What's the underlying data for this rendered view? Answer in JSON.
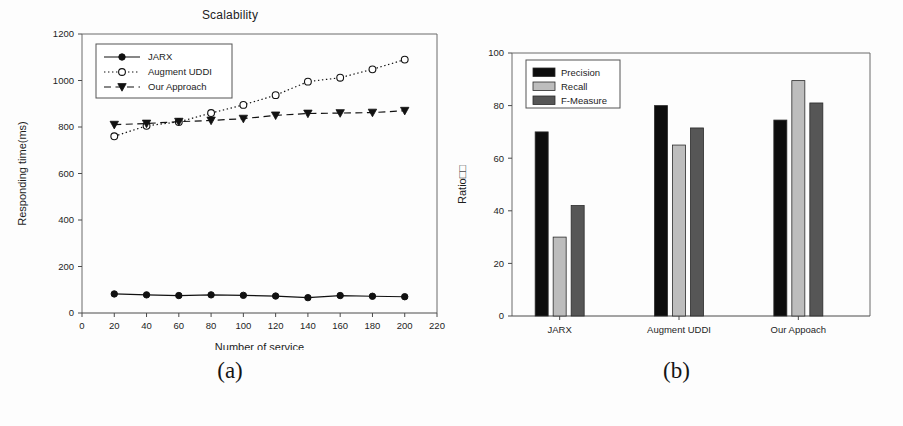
{
  "figure": {
    "panel_a_caption": "(a)",
    "panel_b_caption": "(b)"
  },
  "chart_data": [
    {
      "id": "scalability",
      "type": "line",
      "title": "Scalability",
      "xlabel": "Number of service",
      "ylabel": "Responding time(ms)",
      "xlim": [
        0,
        220
      ],
      "ylim": [
        0,
        1200
      ],
      "xticks": [
        0,
        20,
        40,
        60,
        80,
        100,
        120,
        140,
        160,
        180,
        200,
        220
      ],
      "yticks": [
        0,
        200,
        400,
        600,
        800,
        1000,
        1200
      ],
      "grid": false,
      "legend_position": "upper-left-inside",
      "x": [
        20,
        40,
        60,
        80,
        100,
        120,
        140,
        160,
        180,
        200
      ],
      "series": [
        {
          "name": "JARX",
          "marker": "filled-circle",
          "line_style": "solid",
          "color": "#111111",
          "values": [
            82,
            78,
            75,
            78,
            76,
            73,
            66,
            75,
            72,
            70
          ]
        },
        {
          "name": "Augment UDDI",
          "marker": "open-circle",
          "line_style": "dotted",
          "color": "#111111",
          "values": [
            760,
            805,
            822,
            860,
            895,
            937,
            995,
            1012,
            1048,
            1090
          ]
        },
        {
          "name": "Our Approach",
          "marker": "filled-triangle-down",
          "line_style": "dashed",
          "color": "#111111",
          "values": [
            810,
            815,
            823,
            828,
            836,
            850,
            858,
            860,
            862,
            870
          ]
        }
      ]
    },
    {
      "id": "ratio",
      "type": "bar",
      "title": "",
      "xlabel": "",
      "ylabel": "Ratio□□",
      "ylim": [
        0,
        100
      ],
      "yticks": [
        0,
        20,
        40,
        60,
        80,
        100
      ],
      "grid": false,
      "legend_position": "upper-left-inside",
      "categories": [
        "JARX",
        "Augment UDDI",
        "Our Appoach"
      ],
      "series": [
        {
          "name": "Precision",
          "color": "#0d0d0d",
          "values": [
            70,
            80,
            74.5
          ]
        },
        {
          "name": "Recall",
          "color": "#bdbdbd",
          "values": [
            30,
            65,
            89.5
          ]
        },
        {
          "name": "F-Measure",
          "color": "#565656",
          "values": [
            42,
            71.5,
            81
          ]
        }
      ]
    }
  ]
}
